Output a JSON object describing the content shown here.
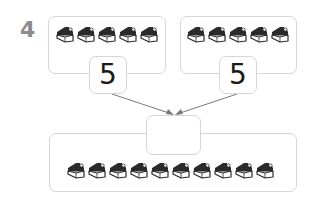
{
  "problem": {
    "number": "4"
  },
  "left_group": {
    "cake_count": 5,
    "icon": "cake-slice-icon",
    "value": "5"
  },
  "right_group": {
    "cake_count": 5,
    "icon": "cake-slice-icon",
    "value": "5"
  },
  "total_group": {
    "cake_count": 10,
    "icon": "cake-slice-icon",
    "answer": ""
  },
  "colors": {
    "border": "#d6d6d6",
    "number_label": "#8c8c8c",
    "arrow": "#7a7a7a",
    "cake_dark": "#2a2a2a"
  }
}
